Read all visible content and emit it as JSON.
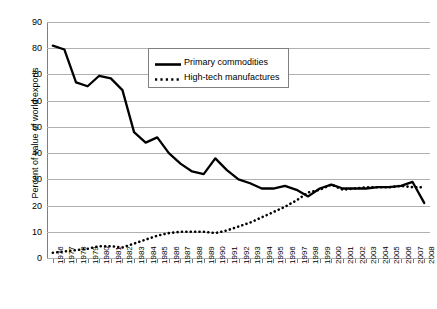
{
  "chart_data": {
    "type": "line",
    "title": "",
    "xlabel": "",
    "ylabel": "Percent of value of world exports",
    "ylim": [
      0,
      90
    ],
    "ytick_step": 10,
    "grid": true,
    "legend_position": "top-center",
    "yticks": [
      "0",
      "10",
      "20",
      "30",
      "40",
      "50",
      "60",
      "70",
      "80",
      "90"
    ],
    "categories": [
      "1976",
      "1977",
      "1978",
      "1979",
      "1980",
      "1981",
      "1982",
      "1983",
      "1984",
      "1985",
      "1986",
      "1987",
      "1988",
      "1989",
      "1990",
      "1991",
      "1992",
      "1993",
      "1994",
      "1995",
      "1996",
      "1997",
      "1998",
      "1999",
      "2000",
      "2001",
      "2002",
      "2003",
      "2004",
      "2005",
      "2006",
      "2007",
      "2008"
    ],
    "series": [
      {
        "name": "Primary commodities",
        "style": "solid",
        "color": "#000000",
        "values": [
          81,
          79.5,
          67,
          65.5,
          69.5,
          68.5,
          64,
          48,
          44,
          46,
          40,
          36,
          33,
          32,
          38,
          33.5,
          30,
          28.5,
          26.5,
          26.5,
          27.5,
          26,
          23.5,
          26.5,
          28,
          26.5,
          26.5,
          26.5,
          27,
          27,
          27.5,
          29,
          21
        ]
      },
      {
        "name": "High-tech manufactures",
        "style": "dotted",
        "color": "#000000",
        "values": [
          2,
          2.5,
          3,
          3.5,
          4.5,
          4.5,
          4,
          5.5,
          7,
          8.5,
          9.5,
          10,
          10,
          10,
          9.5,
          10.5,
          12,
          13.5,
          15.5,
          17.5,
          19.5,
          22,
          25,
          26,
          28,
          26,
          26.5,
          27,
          27,
          27,
          27.5,
          27,
          27
        ]
      }
    ]
  },
  "legend": {
    "items": [
      {
        "label": "Primary commodities",
        "style": "solid"
      },
      {
        "label": "High-tech manufactures",
        "style": "dotted"
      }
    ]
  }
}
